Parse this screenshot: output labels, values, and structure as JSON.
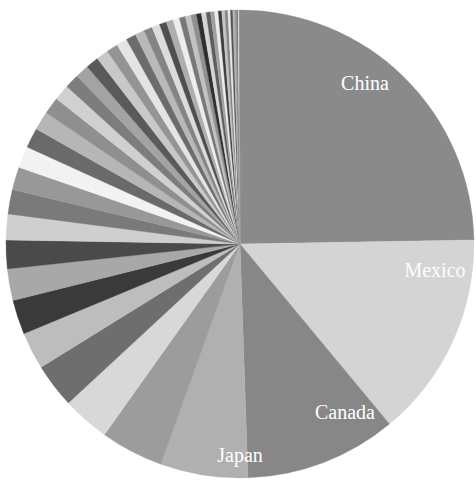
{
  "chart_data": {
    "type": "pie",
    "title": "",
    "subtitle": "",
    "xlabel": "",
    "ylabel": "",
    "legend_position": "none",
    "grid": false,
    "start_angle_deg": 90,
    "direction": "clockwise",
    "labeled_slices": [
      "China",
      "Mexico",
      "Canada",
      "Japan"
    ],
    "center": {
      "x": 240,
      "y": 244
    },
    "radius": 234,
    "categories": [
      "China",
      "Mexico",
      "Canada",
      "Japan",
      "Germany",
      "South Korea",
      "United Kingdom",
      "France",
      "India",
      "Taiwan",
      "Italy",
      "Brazil",
      "Netherlands",
      "Switzerland",
      "Ireland",
      "Singapore",
      "Vietnam",
      "Belgium",
      "Malaysia",
      "Israel",
      "Thailand",
      "Spain",
      "Australia",
      "Sweden",
      "Saudi Arabia",
      "Russia",
      "Indonesia",
      "Colombia",
      "Chile",
      "Austria",
      "Denmark",
      "Philippines",
      "Poland",
      "Turkey",
      "Norway",
      "Argentina",
      "Peru",
      "Nigeria",
      "Finland",
      "Hungary",
      "Portugal",
      "Czechia",
      "Venezuela",
      "Ecuador",
      "New Zealand",
      "Greece",
      "Romania",
      "Kuwait",
      "Qatar",
      "Other"
    ],
    "values": [
      25.0,
      14.4,
      10.6,
      6.1,
      4.4,
      3.3,
      3.1,
      2.6,
      2.4,
      2.2,
      2.0,
      1.8,
      1.7,
      1.6,
      1.5,
      1.4,
      1.3,
      1.2,
      1.1,
      1.0,
      0.95,
      0.9,
      0.85,
      0.8,
      0.75,
      0.7,
      0.65,
      0.6,
      0.55,
      0.5,
      0.48,
      0.45,
      0.42,
      0.4,
      0.38,
      0.35,
      0.33,
      0.3,
      0.28,
      0.26,
      0.24,
      0.22,
      0.2,
      0.18,
      0.16,
      0.14,
      0.12,
      0.1,
      0.08,
      0.06
    ],
    "colors": [
      "#8a8a8a",
      "#d4d4d4",
      "#878787",
      "#b0b0b0",
      "#9c9c9c",
      "#d8d8d8",
      "#6e6e6e",
      "#bdbdbd",
      "#3a3a3a",
      "#a8a8a8",
      "#4a4a4a",
      "#cfcfcf",
      "#7a7a7a",
      "#989898",
      "#f2f2f2",
      "#6a6a6a",
      "#b6b6b6",
      "#8f8f8f",
      "#d0d0d0",
      "#7d7d7d",
      "#a3a3a3",
      "#5a5a5a",
      "#c8c8c8",
      "#949494",
      "#e4e4e4",
      "#6c6c6c",
      "#b9b9b9",
      "#848484",
      "#dcdcdc",
      "#4f4f4f",
      "#aeaeae",
      "#ededed",
      "#787878",
      "#c2c2c2",
      "#909090",
      "#2f2f2f",
      "#d6d6d6",
      "#5e5e5e",
      "#a0a0a0",
      "#ebebeb",
      "#3e3e3e",
      "#c5c5c5",
      "#858585",
      "#e8e8e8",
      "#555555",
      "#b3b3b3",
      "#9a9a9a",
      "#737373",
      "#dedede",
      "#8d8d8d"
    ],
    "label_color": "#ffffff",
    "background": "#ffffff",
    "annotations": [
      {
        "name": "China",
        "x": 365,
        "y": 85,
        "on_light": false
      },
      {
        "name": "Mexico",
        "x": 435,
        "y": 272,
        "on_light": true
      },
      {
        "name": "Canada",
        "x": 345,
        "y": 414,
        "on_light": false
      },
      {
        "name": "Japan",
        "x": 240,
        "y": 457,
        "on_light": false
      }
    ]
  }
}
